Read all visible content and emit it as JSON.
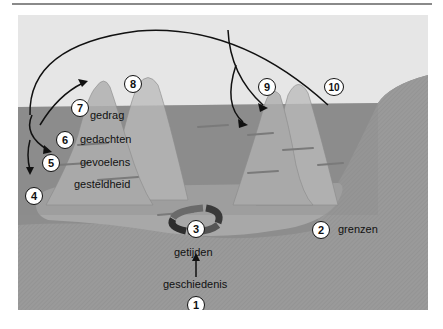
{
  "diagram": {
    "type": "iceberg-model",
    "colors": {
      "sky": "#e6e6e6",
      "water": "#8c8c8c",
      "sea_floor": "#a0a0a0",
      "iceberg_above": "#bdbdbd",
      "iceberg_below": "#b0b0b0",
      "arrows": "#111111",
      "cycle_dark": "#3a3a3a",
      "cycle_mid": "#6a6a6a"
    },
    "iceberg_layers": [
      "gedrag",
      "gedachten",
      "gevoelens",
      "gesteldheid"
    ],
    "labels": {
      "gedrag": "gedrag",
      "gedachten": "gedachten",
      "gevoelens": "gevoelens",
      "gesteldheid": "gesteldheid",
      "getijden": "getijden",
      "geschiedenis": "geschiedenis",
      "grenzen": "grenzen"
    },
    "markers": [
      {
        "id": "1",
        "label": "1"
      },
      {
        "id": "2",
        "label": "2"
      },
      {
        "id": "3",
        "label": "3"
      },
      {
        "id": "4",
        "label": "4"
      },
      {
        "id": "5",
        "label": "5"
      },
      {
        "id": "6",
        "label": "6"
      },
      {
        "id": "7",
        "label": "7"
      },
      {
        "id": "8",
        "label": "8"
      },
      {
        "id": "9",
        "label": "9"
      },
      {
        "id": "10",
        "label": "10"
      }
    ]
  }
}
